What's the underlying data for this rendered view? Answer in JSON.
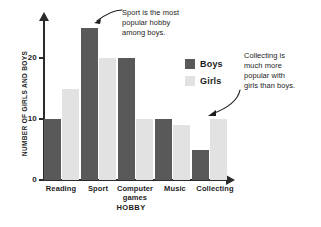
{
  "chart_data": {
    "type": "bar",
    "title": "",
    "xlabel": "HOBBY",
    "ylabel": "NUMBER OF GIRLS AND BOYS",
    "categories": [
      "Reading",
      "Sport",
      "Computer games",
      "Music",
      "Collecting"
    ],
    "series": [
      {
        "name": "Boys",
        "color": "#595959",
        "values": [
          10,
          25,
          20,
          10,
          5
        ]
      },
      {
        "name": "Girls",
        "color": "#e2e2e2",
        "values": [
          15,
          20,
          10,
          9,
          10
        ]
      }
    ],
    "ylim": [
      0,
      26
    ],
    "yticks": [
      0,
      10,
      20
    ],
    "ytick_labels": [
      "0",
      "10",
      "20"
    ],
    "grid": false,
    "legend_position": "inside-right",
    "annotations": [
      {
        "text": "Sport is the most popular hobby among boys.",
        "points_to": "Sport / Boys bar"
      },
      {
        "text": "Collecting is much more popular with girls than boys.",
        "points_to": "Collecting / Girls bar"
      }
    ]
  },
  "axis": {
    "y_title": "NUMBER OF GIRLS AND BOYS",
    "x_title": "HOBBY",
    "ticks": [
      {
        "label": "20",
        "value": 20
      },
      {
        "label": "10",
        "value": 10
      },
      {
        "label": "0",
        "value": 0
      }
    ]
  },
  "categories": [
    {
      "label": "Reading"
    },
    {
      "label": "Sport"
    },
    {
      "label": "Computer",
      "label2": "games"
    },
    {
      "label": "Music"
    },
    {
      "label": "Collecting"
    }
  ],
  "legend": {
    "boys_label": "Boys",
    "girls_label": "Girls"
  },
  "annotations": {
    "sport": {
      "line1": "Sport is the most",
      "line2": "popular hobby",
      "line3": "among boys."
    },
    "collecting": {
      "line1": "Collecting is",
      "line2": "much more",
      "line3": "popular with",
      "line4": "girls than boys."
    }
  },
  "colors": {
    "boys": "#595959",
    "girls": "#e2e2e2",
    "axis": "#2b2b2b",
    "text": "#1d1d1d",
    "background": "#ffffff"
  }
}
